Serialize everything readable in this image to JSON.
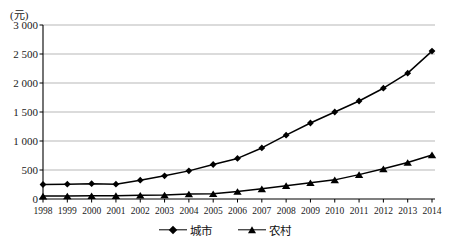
{
  "chart_data": {
    "type": "line",
    "title": "",
    "unit_label": "(元)",
    "xlabel": "",
    "ylabel": "",
    "ylim": [
      0,
      3000
    ],
    "ytick_values": [
      0,
      500,
      1000,
      1500,
      2000,
      2500,
      3000
    ],
    "ytick_labels": [
      "0",
      "500",
      "1 000",
      "1 500",
      "2 000",
      "2 500",
      "3 000"
    ],
    "grid": true,
    "legend_position": "bottom",
    "categories": [
      "1998",
      "1999",
      "2000",
      "2001",
      "2002",
      "2003",
      "2004",
      "2005",
      "2006",
      "2007",
      "2008",
      "2009",
      "2010",
      "2011",
      "2012",
      "2013",
      "2014"
    ],
    "series": [
      {
        "name": "城市",
        "marker": "diamond",
        "values": [
          250,
          255,
          265,
          255,
          325,
          400,
          485,
          595,
          700,
          880,
          1100,
          1310,
          1500,
          1690,
          1910,
          2170,
          2550
        ]
      },
      {
        "name": "农村",
        "marker": "triangle",
        "values": [
          50,
          52,
          55,
          58,
          65,
          70,
          85,
          90,
          130,
          175,
          230,
          280,
          330,
          420,
          520,
          630,
          760
        ]
      }
    ]
  },
  "legend": {
    "entries": [
      {
        "label": "城市",
        "marker": "diamond"
      },
      {
        "label": "农村",
        "marker": "triangle"
      }
    ]
  },
  "axis": {
    "unit": "(元)"
  }
}
